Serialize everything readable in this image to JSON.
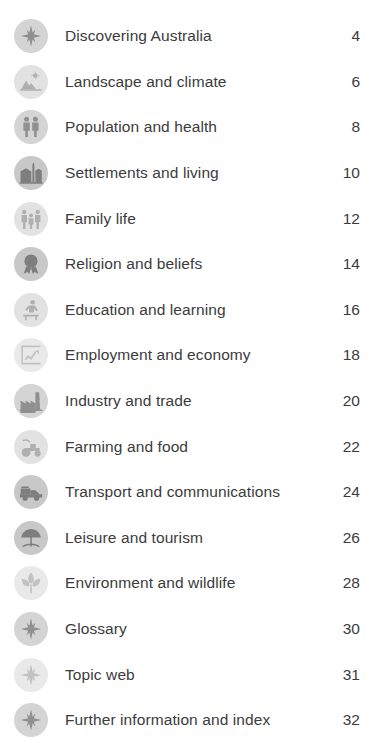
{
  "page": {
    "background_color": "#ffffff",
    "text_color": "#3b3b3b",
    "icon_circle_color": "#d2d2d2",
    "icon_glyph_color": "#8c8c8c",
    "row_count": 15
  },
  "contents": {
    "rows": [
      {
        "icon": "compass-rose-icon",
        "label": "Discovering Australia",
        "page": "4",
        "tint": "tint-mid"
      },
      {
        "icon": "mountain-sun-icon",
        "label": "Landscape and climate",
        "page": "6",
        "tint": "tint-light"
      },
      {
        "icon": "two-people-icon",
        "label": "Population and health",
        "page": "8",
        "tint": "tint-mid"
      },
      {
        "icon": "city-buildings-icon",
        "label": "Settlements and living",
        "page": "10",
        "tint": "tint-strong"
      },
      {
        "icon": "family-group-icon",
        "label": "Family life",
        "page": "12",
        "tint": "tint-light"
      },
      {
        "icon": "award-rosette-icon",
        "label": "Religion and beliefs",
        "page": "14",
        "tint": "tint-strong"
      },
      {
        "icon": "student-desk-icon",
        "label": "Education and learning",
        "page": "16",
        "tint": "tint-light"
      },
      {
        "icon": "chart-clipboard-icon",
        "label": "Employment and economy",
        "page": "18",
        "tint": "tint-faint"
      },
      {
        "icon": "factory-icon",
        "label": "Industry and trade",
        "page": "20",
        "tint": "tint-mid"
      },
      {
        "icon": "tractor-icon",
        "label": "Farming and food",
        "page": "22",
        "tint": "tint-light"
      },
      {
        "icon": "truck-icon",
        "label": "Transport and communications",
        "page": "24",
        "tint": "tint-strong"
      },
      {
        "icon": "beach-umbrella-icon",
        "label": "Leisure and tourism",
        "page": "26",
        "tint": "tint-strong"
      },
      {
        "icon": "plant-leaf-icon",
        "label": "Environment and wildlife",
        "page": "28",
        "tint": "tint-faint"
      },
      {
        "icon": "compass-rose-icon",
        "label": "Glossary",
        "page": "30",
        "tint": "tint-mid"
      },
      {
        "icon": "compass-rose-icon",
        "label": "Topic web",
        "page": "31",
        "tint": "tint-faint"
      },
      {
        "icon": "compass-rose-icon",
        "label": "Further information and index",
        "page": "32",
        "tint": "tint-mid"
      }
    ]
  }
}
